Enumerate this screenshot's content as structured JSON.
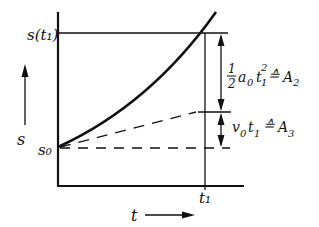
{
  "diagram": {
    "axes": {
      "x_label": "t",
      "y_label": "s"
    },
    "labels": {
      "s_t1": "s(t₁)",
      "s0": "s₀",
      "t1": "t₁",
      "area2_label": "½ a₀ t₁² ≙ A₂",
      "area3_label": "v₀ t₁ ≙ A₃"
    },
    "elements": {
      "curve": "s(t) parabola starting at s₀",
      "tangent": "dashed line of slope v₀ from s₀",
      "baseline": "dashed horizontal line at s₀",
      "dimension_arrows": [
        "A₂ span between tangent and s(t₁)",
        "A₃ span between s₀ and tangent"
      ]
    },
    "colors": {
      "ink": "#111111",
      "background": "#ffffff"
    }
  }
}
